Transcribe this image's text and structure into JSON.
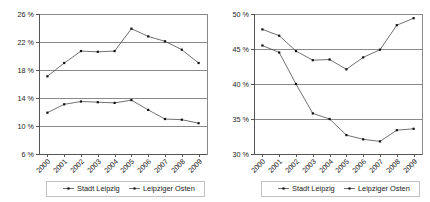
{
  "colors": {
    "background": "#ffffff",
    "grid": "#8a8a8a",
    "axis": "#555555",
    "series_line": "#4d4d4d",
    "marker": "#111111",
    "text": "#1a1a1a"
  },
  "legend": {
    "series_1_label": "Stadt Leipzig",
    "series_2_label": "Leipziger Osten"
  },
  "chart_data": [
    {
      "id": "left-chart",
      "type": "line",
      "title": "",
      "xlabel": "",
      "ylabel": "",
      "grid": true,
      "legend_position": "bottom",
      "x": [
        "2000",
        "2001",
        "2002",
        "2003",
        "2004",
        "2005",
        "2006",
        "2007",
        "2008",
        "2009"
      ],
      "ytick_labels": [
        "26 %",
        "22 %",
        "18 %",
        "14 %",
        "10 %",
        "6 %"
      ],
      "ytick_values": [
        26,
        22,
        18,
        14,
        10,
        6
      ],
      "ylim": [
        6,
        26
      ],
      "series": [
        {
          "name": "Stadt Leipzig",
          "values": [
            11.9,
            13.1,
            13.5,
            13.4,
            13.3,
            13.7,
            12.3,
            11.0,
            10.9,
            10.4
          ]
        },
        {
          "name": "Leipziger Osten",
          "values": [
            17.1,
            19.0,
            20.7,
            20.6,
            20.7,
            23.9,
            22.8,
            22.1,
            20.9,
            19.0
          ]
        }
      ]
    },
    {
      "id": "right-chart",
      "type": "line",
      "title": "",
      "xlabel": "",
      "ylabel": "",
      "grid": true,
      "legend_position": "bottom",
      "x": [
        "2000",
        "2001",
        "2002",
        "2003",
        "2004",
        "2005",
        "2006",
        "2007",
        "2008",
        "2009"
      ],
      "ytick_labels": [
        "50 %",
        "45 %",
        "40 %",
        "35 %",
        "30 %"
      ],
      "ytick_values": [
        50,
        45,
        40,
        35,
        30
      ],
      "ylim": [
        30,
        50
      ],
      "series": [
        {
          "name": "Stadt Leipzig",
          "values": [
            47.8,
            46.9,
            44.7,
            43.4,
            43.5,
            42.1,
            43.8,
            44.9,
            48.4,
            49.4
          ]
        },
        {
          "name": "Leipziger Osten",
          "values": [
            45.5,
            44.5,
            40.0,
            35.8,
            35.0,
            32.7,
            32.1,
            31.8,
            33.4,
            33.6
          ]
        }
      ]
    }
  ]
}
